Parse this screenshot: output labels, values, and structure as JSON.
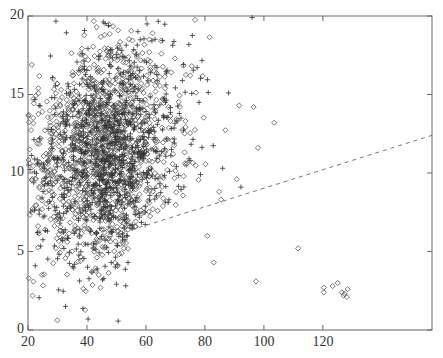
{
  "chart_data": {
    "type": "scatter",
    "title": "",
    "xlabel": "",
    "ylabel": "",
    "xlim": [
      20,
      157
    ],
    "ylim": [
      0,
      20
    ],
    "x_ticks": [
      20,
      40,
      60,
      80,
      100,
      120
    ],
    "y_ticks": [
      0,
      5,
      10,
      15,
      20
    ],
    "x_tick_labels": [
      "20",
      "40",
      "60",
      "80",
      "100",
      "120"
    ],
    "y_tick_labels": [
      "0",
      "5",
      "10",
      "15",
      "20"
    ],
    "grid": false,
    "legend": null,
    "series": [
      {
        "name": "diamonds",
        "marker": "diamond",
        "color": "#555555",
        "cluster": {
          "center": [
            42,
            11
          ],
          "sd": [
            12,
            3.4
          ],
          "count": 1300,
          "x_min": 20,
          "y_min": 0.3,
          "y_max": 19.8
        },
        "outliers": [
          [
            90.8,
            9.6
          ],
          [
            85.5,
            8.3
          ],
          [
            84.8,
            8.8
          ],
          [
            111.6,
            5.2
          ],
          [
            97.3,
            3.1
          ],
          [
            80.8,
            6.0
          ],
          [
            83.0,
            4.3
          ],
          [
            96.5,
            14.2
          ],
          [
            103.5,
            13.2
          ],
          [
            98.0,
            11.6
          ],
          [
            120.3,
            2.7
          ],
          [
            120.3,
            2.4
          ],
          [
            123.3,
            2.8
          ],
          [
            125.0,
            3.0
          ],
          [
            126.4,
            2.4
          ],
          [
            127.4,
            2.3
          ],
          [
            128.1,
            2.1
          ],
          [
            128.4,
            2.6
          ],
          [
            127.0,
            2.2
          ]
        ]
      },
      {
        "name": "crosses",
        "marker": "plus",
        "color": "#333333",
        "cluster": {
          "center": [
            44,
            11
          ],
          "sd": [
            12,
            3.6
          ],
          "count": 900,
          "x_min": 20,
          "y_min": 0.3,
          "y_max": 19.8
        },
        "outliers": [
          [
            92.2,
            9.1
          ],
          [
            78.0,
            14.5
          ],
          [
            88.0,
            15.1
          ],
          [
            78.5,
            9.9
          ],
          [
            86.0,
            10.3
          ],
          [
            96.0,
            19.9
          ]
        ]
      }
    ],
    "reference_line": {
      "style": "dashed",
      "color": "#777777",
      "points": [
        [
          42,
          5.6
        ],
        [
          157,
          12.4
        ]
      ]
    }
  }
}
